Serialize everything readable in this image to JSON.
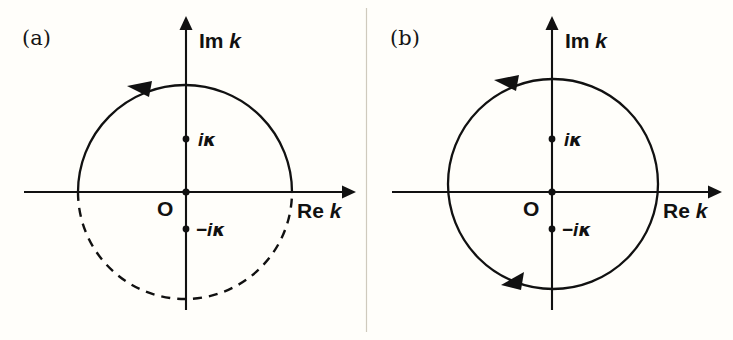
{
  "figure": {
    "background_color": "#fffefa",
    "ink_color": "#111111"
  },
  "panels": [
    {
      "id": "a",
      "label": "(a)",
      "axes": {
        "imaginary": {
          "prefix": "Im",
          "variable": "k"
        },
        "real": {
          "prefix": "Re",
          "variable": "k"
        }
      },
      "origin": {
        "label": "O"
      },
      "poles": [
        {
          "name": "upper-pole",
          "sign": "",
          "imaginary_unit": "i",
          "symbol": "κ",
          "label": "iκ"
        },
        {
          "name": "lower-pole",
          "sign": "−",
          "imaginary_unit": "i",
          "symbol": "κ",
          "label": "−iκ"
        }
      ],
      "contour": {
        "upper_arc_style": "solid",
        "lower_arc_style": "dashed",
        "direction": "counterclockwise",
        "arrow_count": 1
      }
    },
    {
      "id": "b",
      "label": "(b)",
      "axes": {
        "imaginary": {
          "prefix": "Im",
          "variable": "k"
        },
        "real": {
          "prefix": "Re",
          "variable": "k"
        }
      },
      "origin": {
        "label": "O"
      },
      "poles": [
        {
          "name": "upper-pole",
          "sign": "",
          "imaginary_unit": "i",
          "symbol": "κ",
          "label": "iκ"
        },
        {
          "name": "lower-pole",
          "sign": "−",
          "imaginary_unit": "i",
          "symbol": "κ",
          "label": "−iκ"
        }
      ],
      "contour": {
        "upper_arc_style": "solid",
        "lower_arc_style": "solid",
        "direction": "counterclockwise",
        "arrow_count": 2
      }
    }
  ]
}
